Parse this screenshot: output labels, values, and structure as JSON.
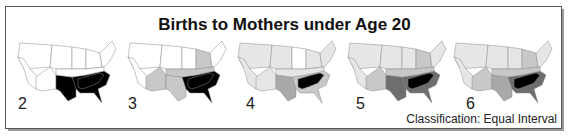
{
  "title": "Births to Mothers under Age 20",
  "caption": "Classification: Equal Interval",
  "colors": {
    "c0": "#ffffff",
    "c1": "#e6e6e6",
    "c2": "#c8c8c8",
    "c3": "#a9a9a9",
    "c4": "#6e6e6e",
    "c5": "#000000",
    "stroke": "#8a8a8a"
  },
  "maps": [
    {
      "classes": "2",
      "label": "2"
    },
    {
      "classes": "3",
      "label": "3"
    },
    {
      "classes": "4",
      "label": "4"
    },
    {
      "classes": "5",
      "label": "5"
    },
    {
      "classes": "6",
      "label": "6"
    }
  ]
}
